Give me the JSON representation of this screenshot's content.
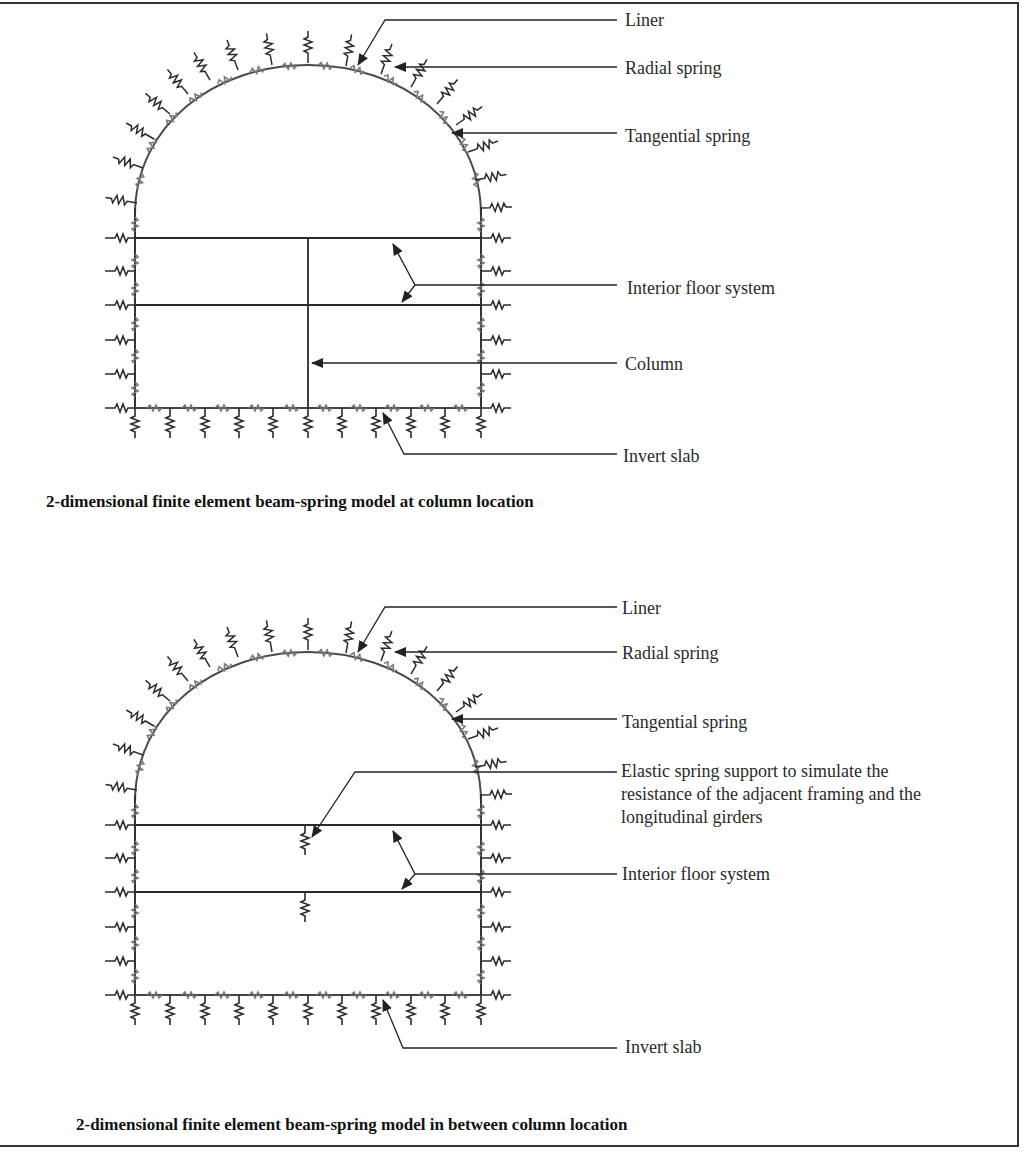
{
  "diagrams": [
    {
      "id": "at-column",
      "caption": "2-dimensional finite element beam-spring model at column location",
      "labels": {
        "liner": "Liner",
        "radial_spring": "Radial spring",
        "tangential_spring": "Tangential spring",
        "interior_floor_system": "Interior floor system",
        "column": "Column",
        "invert_slab": "Invert slab"
      }
    },
    {
      "id": "between-column",
      "caption": "2-dimensional finite element beam-spring model in between column location",
      "labels": {
        "liner": "Liner",
        "radial_spring": "Radial spring",
        "tangential_spring": "Tangential spring",
        "elastic_spring_support": "Elastic spring support to simulate the resistance of the adjacent framing and the longitudinal girders",
        "interior_floor_system": "Interior floor system",
        "invert_slab": "Invert slab"
      }
    }
  ],
  "colors": {
    "line": "#2b2b2b",
    "liner_spring": "#7a7a7a",
    "background": "#ffffff"
  }
}
